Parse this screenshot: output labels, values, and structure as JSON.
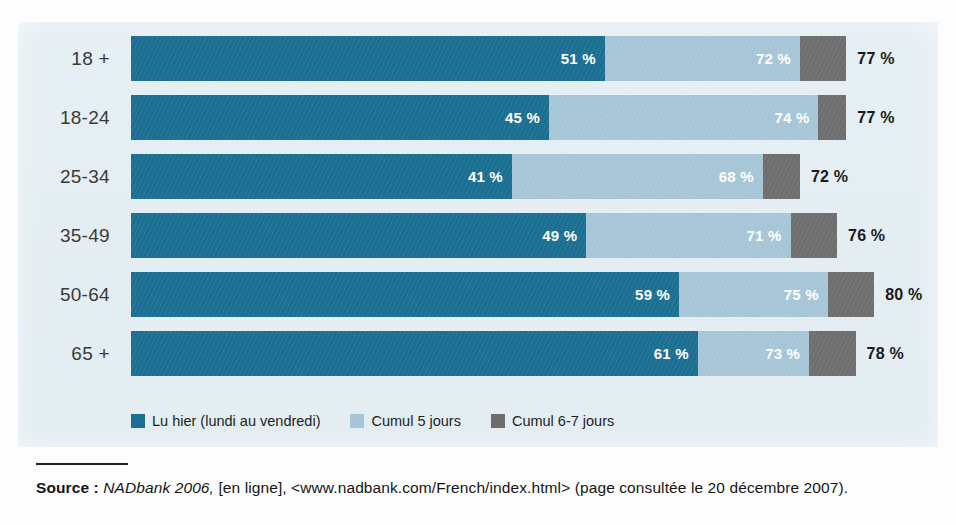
{
  "colors": {
    "series_read_yesterday": "#1B6F92",
    "series_cumulative_5": "#A6C6D8",
    "series_cumulative_67": "#6E6E6E",
    "panel_background": "#E6EFF3",
    "page_background": "#FDFDFD",
    "label_text": "#3A3A3A",
    "value_text_inside": "#FFFFFF",
    "total_text": "#1A1A1A"
  },
  "chart_data": {
    "type": "bar",
    "orientation": "horizontal",
    "stacked": true,
    "cumulative": true,
    "title": "",
    "xlabel": "",
    "ylabel": "",
    "grid": false,
    "legend_position": "bottom-left",
    "xlim": [
      0,
      80
    ],
    "categories": [
      "18 +",
      "18-24",
      "25-34",
      "35-49",
      "50-64",
      "65 +"
    ],
    "series": [
      {
        "name": "Lu hier (lundi au vendredi)",
        "color": "#1B6F92",
        "values": [
          51,
          45,
          41,
          49,
          59,
          61
        ],
        "labels": [
          "51 %",
          "45 %",
          "41 %",
          "49 %",
          "59 %",
          "61 %"
        ]
      },
      {
        "name": "Cumul 5 jours",
        "color": "#A6C6D8",
        "values": [
          72,
          74,
          68,
          71,
          75,
          73
        ],
        "labels": [
          "72 %",
          "74 %",
          "68 %",
          "71 %",
          "75 %",
          "73 %"
        ]
      },
      {
        "name": "Cumul 6-7 jours",
        "color": "#6E6E6E",
        "values": [
          77,
          77,
          72,
          76,
          80,
          78
        ],
        "labels": [
          "77 %",
          "77 %",
          "72 %",
          "76 %",
          "80 %",
          "78 %"
        ]
      }
    ],
    "rows": [
      {
        "category": "18 +",
        "v1": 51,
        "v2": 72,
        "v3": 77,
        "l1": "51 %",
        "l2": "72 %",
        "l3": "77 %"
      },
      {
        "category": "18-24",
        "v1": 45,
        "v2": 74,
        "v3": 77,
        "l1": "45 %",
        "l2": "74 %",
        "l3": "77 %"
      },
      {
        "category": "25-34",
        "v1": 41,
        "v2": 68,
        "v3": 72,
        "l1": "41 %",
        "l2": "68 %",
        "l3": "72 %"
      },
      {
        "category": "35-49",
        "v1": 49,
        "v2": 71,
        "v3": 76,
        "l1": "49 %",
        "l2": "71 %",
        "l3": "76 %"
      },
      {
        "category": "50-64",
        "v1": 59,
        "v2": 75,
        "v3": 80,
        "l1": "59 %",
        "l2": "75 %",
        "l3": "80 %"
      },
      {
        "category": "65 +",
        "v1": 61,
        "v2": 73,
        "v3": 78,
        "l1": "61 %",
        "l2": "73 %",
        "l3": "78 %"
      }
    ]
  },
  "legend": {
    "items": [
      {
        "label": "Lu hier (lundi au vendredi)",
        "color": "#1B6F92",
        "swatch_name": "legend-swatch-lu-hier"
      },
      {
        "label": "Cumul 5 jours",
        "color": "#A6C6D8",
        "swatch_name": "legend-swatch-cumul-5-jours"
      },
      {
        "label": "Cumul 6-7 jours",
        "color": "#6E6E6E",
        "swatch_name": "legend-swatch-cumul-6-7-jours"
      }
    ]
  },
  "source": {
    "label": "Source :",
    "italic_part": "NADbank 2006,",
    "rest": " [en ligne], <www.nadbank.com/French/index.html> (page consultée le 20 décembre 2007)."
  }
}
